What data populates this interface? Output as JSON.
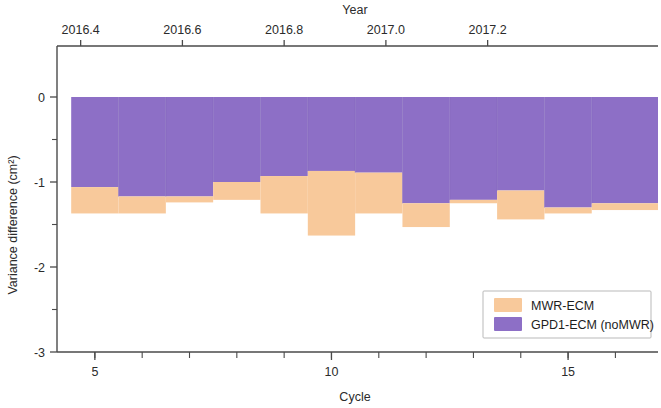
{
  "chart_data": {
    "type": "bar",
    "title": "",
    "xlabel": "Cycle",
    "ylabel": "Variance difference (cm²)",
    "secondary_xlabel": "Year",
    "ylim": [
      -3,
      0.35
    ],
    "xlim": [
      4.2,
      16.9
    ],
    "grid": false,
    "legend_position": "bottom-right",
    "x_ticks": [
      5,
      10,
      15
    ],
    "x_tick_labels": [
      "5",
      "10",
      "15"
    ],
    "x_minor_ticks": [
      5,
      6,
      7,
      8,
      9,
      10,
      11,
      12,
      13,
      14,
      15,
      16
    ],
    "y_ticks": [
      0,
      -1,
      -2,
      -3
    ],
    "y_tick_labels": [
      "0",
      "-1",
      "-2",
      "-3"
    ],
    "y_minor_ticks": [
      -0.5,
      -1.5,
      -2.5
    ],
    "top_axis_ticks": [
      2016.4,
      2016.6,
      2016.8,
      2017.0,
      2017.2
    ],
    "top_axis_tick_labels": [
      "2016.4",
      "2016.6",
      "2016.8",
      "2017.0",
      "2017.2"
    ],
    "top_axis_positions": [
      4.7,
      6.85,
      9.0,
      11.15,
      13.3
    ],
    "categories": [
      5,
      6,
      7,
      8,
      9,
      10,
      11,
      12,
      13,
      14,
      15,
      16
    ],
    "bar_left_edges": [
      4.5,
      5.5,
      6.5,
      7.5,
      8.5,
      9.5,
      10.5,
      11.5,
      12.5,
      13.5,
      14.5,
      15.5
    ],
    "bar_right_edges": [
      5.5,
      6.5,
      7.5,
      8.5,
      9.5,
      10.5,
      11.5,
      12.5,
      13.5,
      14.5,
      15.5,
      16.9
    ],
    "series": [
      {
        "name": "GPD1-ECM (noMWR)",
        "color": "#8d6fc6",
        "values": [
          -1.06,
          -1.17,
          -1.17,
          -1.0,
          -0.93,
          -0.87,
          -0.89,
          -1.25,
          -1.21,
          -1.1,
          -1.3,
          -1.25
        ]
      },
      {
        "name": "MWR-ECM",
        "color": "#f8c99b",
        "values": [
          -1.37,
          -1.37,
          -1.24,
          -1.21,
          -1.37,
          -1.63,
          -1.37,
          -1.53,
          -1.25,
          -1.44,
          -1.37,
          -1.33
        ]
      }
    ],
    "legend": [
      {
        "label": "MWR-ECM",
        "color": "#f8c99b"
      },
      {
        "label": "GPD1-ECM (noMWR)",
        "color": "#8d6fc6"
      }
    ]
  }
}
